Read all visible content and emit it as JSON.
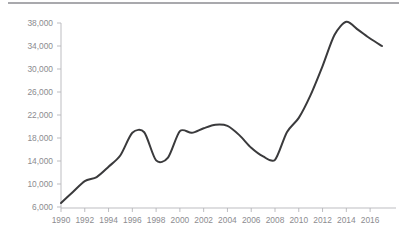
{
  "figure": {
    "name": "line-chart-figure",
    "background_color": "#ffffff",
    "top_rule_color": "#a9a9ad"
  },
  "style": {
    "line_color": "#3a3a3c",
    "axis_color": "#b6b6ba",
    "tick_label_color": "#8c8c90"
  },
  "chart_data": {
    "type": "line",
    "title": "",
    "subtitle": "",
    "xlabel": "",
    "ylabel": "",
    "grid": false,
    "legend": false,
    "legend_position": "none",
    "xlim": [
      1990,
      2017
    ],
    "ylim": [
      6000,
      38000
    ],
    "ytick_labels": [
      "6,000",
      "10,000",
      "14,000",
      "18,000",
      "22,000",
      "26,000",
      "30,000",
      "34,000",
      "38,000"
    ],
    "ytick_values": [
      6000,
      10000,
      14000,
      18000,
      22000,
      26000,
      30000,
      34000,
      38000
    ],
    "xtick_labels": [
      "1990",
      "1992",
      "1994",
      "1996",
      "1998",
      "2000",
      "2002",
      "2004",
      "2006",
      "2008",
      "2010",
      "2012",
      "2014",
      "2016"
    ],
    "xtick_values": [
      1990,
      1992,
      1994,
      1996,
      1998,
      2000,
      2002,
      2004,
      2006,
      2008,
      2010,
      2012,
      2014,
      2016
    ],
    "x": [
      1990,
      1991,
      1992,
      1993,
      1994,
      1995,
      1996,
      1997,
      1998,
      1999,
      2000,
      2001,
      2002,
      2003,
      2004,
      2005,
      2006,
      2007,
      2008,
      2009,
      2010,
      2011,
      2012,
      2013,
      2014,
      2015,
      2016,
      2017
    ],
    "values": [
      6700,
      8600,
      10500,
      11200,
      13000,
      15000,
      18900,
      19000,
      14100,
      14600,
      19200,
      18900,
      19700,
      20300,
      20100,
      18500,
      16300,
      14800,
      14200,
      19000,
      21500,
      25500,
      30500,
      35900,
      38200,
      36800,
      35300,
      34000
    ],
    "series": [
      {
        "name": "series-1",
        "values": [
          6700,
          8600,
          10500,
          11200,
          13000,
          15000,
          18900,
          19000,
          14100,
          14600,
          19200,
          18900,
          19700,
          20300,
          20100,
          18500,
          16300,
          14800,
          14200,
          19000,
          21500,
          25500,
          30500,
          35900,
          38200,
          36800,
          35300,
          34000
        ]
      }
    ]
  }
}
